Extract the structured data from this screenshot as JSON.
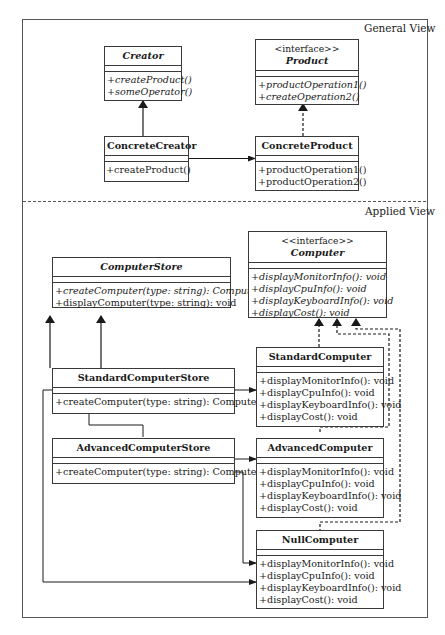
{
  "views": {
    "general_label": "General View",
    "applied_label": "Applied View"
  },
  "general": {
    "creator": {
      "name": "Creator",
      "operations": [
        "+createProduct()",
        "+someOperator()"
      ]
    },
    "product": {
      "stereotype": "<interface>>",
      "name": "Product",
      "operations": [
        "+productOperation1()",
        "+createOperation2()"
      ]
    },
    "concrete_creator": {
      "name": "ConcreteCreator",
      "operations": [
        "+createProduct()"
      ]
    },
    "concrete_product": {
      "name": "ConcreteProduct",
      "operations": [
        "+productOperation1()",
        "+productOperation2()"
      ]
    }
  },
  "applied": {
    "computer_store": {
      "name": "ComputerStore",
      "operations": [
        "+createComputer(type: string): Computer*",
        "+displayComputer(type: string): void"
      ]
    },
    "computer": {
      "stereotype": "<<interface>>",
      "name": "Computer",
      "operations": [
        "+displayMonitorInfo(): void",
        "+displayCpuInfo(): void",
        "+displayKeyboardInfo(): void",
        "+displayCost(): void"
      ]
    },
    "standard_store": {
      "name": "StandardComputerStore",
      "operations": [
        "+createComputer(type: string): Computer*"
      ]
    },
    "advanced_store": {
      "name": "AdvancedComputerStore",
      "operations": [
        "+createComputer(type: string): Computer*"
      ]
    },
    "standard_computer": {
      "name": "StandardComputer",
      "operations": [
        "+displayMonitorInfo(): void",
        "+displayCpuInfo(): void",
        "+displayKeyboardInfo(): void",
        "+displayCost(): void"
      ]
    },
    "advanced_computer": {
      "name": "AdvancedComputer",
      "operations": [
        "+displayMonitorInfo(): void",
        "+displayCpuInfo(): void",
        "+displayKeyboardInfo(): void",
        "+displayCost(): void"
      ]
    },
    "null_computer": {
      "name": "NullComputer",
      "operations": [
        "+displayMonitorInfo(): void",
        "+displayCpuInfo(): void",
        "+displayKeyboardInfo(): void",
        "+displayCost(): void"
      ]
    }
  },
  "colors": {
    "line": "#3a3a3a",
    "background": "#ffffff"
  }
}
